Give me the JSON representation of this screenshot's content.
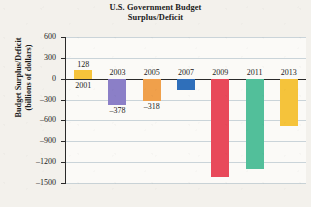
{
  "chart_data": {
    "type": "bar",
    "title": "U.S. Government Budget Surplus/Deficit",
    "title_line1": "U.S. Government Budget",
    "title_line2": "Surplus/Deficit",
    "xlabel": "",
    "ylabel": "Budget Surplus/Deficit",
    "ylabel_line1": "Budget Surplus/Deficit",
    "ylabel_line2": "(billions of dollars)",
    "ylim": [
      -1500,
      600
    ],
    "ytick_step": 300,
    "yticks": [
      600,
      300,
      0,
      -300,
      -600,
      -900,
      -1200,
      -1500
    ],
    "ytick_labels": [
      "600",
      "300",
      "0",
      "–300",
      "–600",
      "–900",
      "–1200",
      "–1500"
    ],
    "grid": true,
    "legend": false,
    "categories": [
      "2001",
      "2003",
      "2005",
      "2007",
      "2009",
      "2011",
      "2013"
    ],
    "values": [
      128,
      -378,
      -318,
      -161,
      -1413,
      -1300,
      -680
    ],
    "bars": [
      {
        "year": "2001",
        "value": 128,
        "label": "128",
        "label_shown": true,
        "color": "#f5c33b"
      },
      {
        "year": "2003",
        "value": -378,
        "label": "–378",
        "label_shown": true,
        "color": "#8b7fc7"
      },
      {
        "year": "2005",
        "value": -318,
        "label": "–318",
        "label_shown": true,
        "color": "#f0a04b"
      },
      {
        "year": "2007",
        "value": -161,
        "label": "",
        "label_shown": false,
        "color": "#2f6fba"
      },
      {
        "year": "2009",
        "value": -1413,
        "label": "",
        "label_shown": false,
        "color": "#e8495a"
      },
      {
        "year": "2011",
        "value": -1300,
        "label": "",
        "label_shown": false,
        "color": "#52bf9a"
      },
      {
        "year": "2013",
        "value": -680,
        "label": "",
        "label_shown": false,
        "color": "#f5c33b"
      }
    ]
  },
  "colors": {
    "page_background": "#f3f1ec",
    "plot_background": "#fbfaf7",
    "axis": "#2a2a2a",
    "gridline": "#b9c7cf",
    "text": "#1b1b1b"
  }
}
